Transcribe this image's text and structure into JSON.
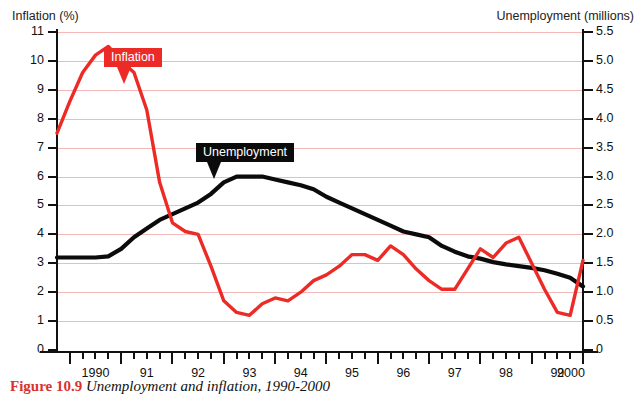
{
  "figure": {
    "caption_number": "Figure 10.9",
    "caption_text": "Unemployment and inflation, 1990-2000"
  },
  "axes": {
    "left_title": "Inflation (%)",
    "right_title": "Unemployment (millions)",
    "left_ticks": [
      "11",
      "10",
      "9",
      "8",
      "7",
      "6",
      "5",
      "4",
      "3",
      "2",
      "1",
      "0"
    ],
    "right_ticks": [
      "5.5",
      "5.0",
      "4.5",
      "4.0",
      "3.5",
      "3.0",
      "2.5",
      "2.0",
      "1.5",
      "1.0",
      "0.5",
      "0"
    ],
    "x_ticks": [
      "1990",
      "91",
      "92",
      "93",
      "94",
      "95",
      "96",
      "97",
      "98",
      "99",
      "2000"
    ]
  },
  "callouts": {
    "inflation": "Inflation",
    "unemployment": "Unemployment"
  },
  "colors": {
    "inflation": "#ec2b26",
    "unemployment": "#0b0b0b",
    "gridline": "#f3b9b9",
    "caption_number": "#d8332e"
  },
  "chart_data": {
    "type": "line",
    "title": "Unemployment and inflation, 1990-2000",
    "xlabel": "",
    "ylabel": "Inflation (%)",
    "y2label": "Unemployment (millions)",
    "ylim": [
      0,
      11
    ],
    "y2lim": [
      0,
      5.5
    ],
    "xlim": [
      1989.75,
      2000.0
    ],
    "grid": true,
    "legend_position": "inline-callouts",
    "x_tick_labels": [
      "1990",
      "91",
      "92",
      "93",
      "94",
      "95",
      "96",
      "97",
      "98",
      "99",
      "2000"
    ],
    "x_tick_values": [
      1990,
      1991,
      1992,
      1993,
      1994,
      1995,
      1996,
      1997,
      1998,
      1999,
      2000
    ],
    "minor_ticks_per_year": 4,
    "series": [
      {
        "name": "Inflation",
        "unit": "%",
        "axis": "left",
        "color": "#ec2b26",
        "x": [
          1989.75,
          1990.0,
          1990.25,
          1990.5,
          1990.75,
          1991.0,
          1991.25,
          1991.5,
          1991.75,
          1992.0,
          1992.25,
          1992.5,
          1992.75,
          1993.0,
          1993.25,
          1993.5,
          1993.75,
          1994.0,
          1994.25,
          1994.5,
          1994.75,
          1995.0,
          1995.25,
          1995.5,
          1995.75,
          1996.0,
          1996.25,
          1996.5,
          1996.75,
          1997.0,
          1997.25,
          1997.5,
          1997.75,
          1998.0,
          1998.25,
          1998.5,
          1998.75,
          1999.0,
          1999.25,
          1999.5,
          1999.75,
          2000.0
        ],
        "values": [
          7.5,
          8.6,
          9.6,
          10.2,
          10.5,
          10.0,
          9.6,
          8.3,
          5.8,
          4.4,
          4.1,
          4.0,
          2.9,
          1.7,
          1.3,
          1.2,
          1.6,
          1.8,
          1.7,
          2.0,
          2.4,
          2.6,
          2.9,
          3.3,
          3.3,
          3.1,
          3.6,
          3.3,
          2.8,
          2.4,
          2.1,
          2.1,
          2.8,
          3.5,
          3.2,
          3.7,
          3.9,
          3.0,
          2.1,
          1.3,
          1.2,
          3.1
        ]
      },
      {
        "name": "Unemployment",
        "unit": "millions",
        "axis": "right",
        "color": "#0b0b0b",
        "x": [
          1989.75,
          1990.0,
          1990.25,
          1990.5,
          1990.75,
          1991.0,
          1991.25,
          1991.5,
          1991.75,
          1992.0,
          1992.25,
          1992.5,
          1992.75,
          1993.0,
          1993.25,
          1993.5,
          1993.75,
          1994.0,
          1994.25,
          1994.5,
          1994.75,
          1995.0,
          1995.25,
          1995.5,
          1995.75,
          1996.0,
          1996.25,
          1996.5,
          1996.75,
          1997.0,
          1997.25,
          1997.5,
          1997.75,
          1998.0,
          1998.25,
          1998.5,
          1998.75,
          1999.0,
          1999.25,
          1999.5,
          1999.75,
          2000.0
        ],
        "values": [
          1.6,
          1.6,
          1.6,
          1.6,
          1.62,
          1.75,
          1.95,
          2.1,
          2.25,
          2.35,
          2.45,
          2.55,
          2.7,
          2.9,
          3.0,
          3.0,
          3.0,
          2.95,
          2.9,
          2.85,
          2.78,
          2.65,
          2.55,
          2.45,
          2.35,
          2.25,
          2.15,
          2.05,
          2.0,
          1.95,
          1.8,
          1.7,
          1.62,
          1.58,
          1.52,
          1.48,
          1.45,
          1.42,
          1.38,
          1.32,
          1.25,
          1.1
        ]
      }
    ],
    "annotations": [
      {
        "text": "Inflation",
        "style": "red-callout"
      },
      {
        "text": "Unemployment",
        "style": "black-callout"
      }
    ]
  }
}
